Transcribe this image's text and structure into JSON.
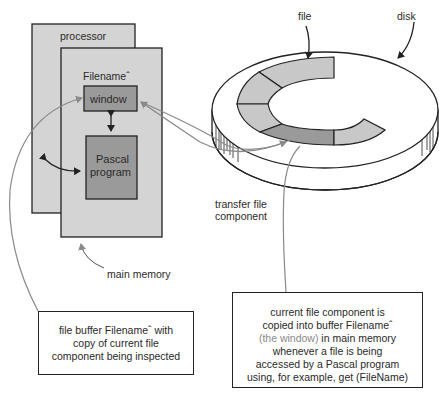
{
  "diagram": {
    "processor_label": "processor",
    "filename_label": "Filenameˆ",
    "window_label": "window",
    "pascal_label_line1": "Pascal",
    "pascal_label_line2": "program",
    "file_label": "file",
    "disk_label": "disk",
    "transfer_line1": "transfer file",
    "transfer_line2": "component",
    "main_memory_label": "main memory",
    "left_note": {
      "line1": "file buffer Filenameˆ with",
      "line2": "copy of current file",
      "line3": "component being inspected"
    },
    "right_note": {
      "line1": "current file component is",
      "line2": "copied into buffer Filenameˆ",
      "line3_highlight": "(the window)",
      "line3_rest": " in main memory",
      "line4": "whenever a file is being",
      "line5": "accessed by a Pascal program",
      "line6": "using, for example, get (FileName)"
    },
    "colors": {
      "memory_fill": "#d4d4d4",
      "window_fill": "#9a9a9a",
      "file_segment_fill": "#c8c8c8",
      "current_segment_fill": "#9a9a9a",
      "arrow_gray": "#8a8a8a",
      "outline": "#222222"
    }
  }
}
